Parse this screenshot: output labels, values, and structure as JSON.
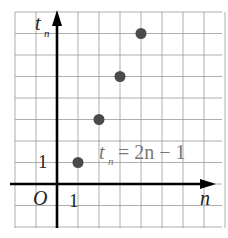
{
  "chart_data": {
    "type": "scatter",
    "title": "",
    "xlabel": "n",
    "ylabel": "t_n",
    "x": [
      1,
      2,
      3,
      4
    ],
    "y": [
      1,
      3,
      5,
      7
    ],
    "annotation": "t_n = 2n − 1",
    "origin_label": "O",
    "x_tick_labels": [
      "1"
    ],
    "y_tick_labels": [
      "1"
    ],
    "grid": true,
    "xlim": [
      -2,
      8
    ],
    "ylim": [
      -2,
      8
    ]
  },
  "labels": {
    "y_axis_main": "t",
    "y_axis_sub": "n",
    "x_axis": "n",
    "origin": "O",
    "x_tick": "1",
    "y_tick": "1",
    "formula_t": "t",
    "formula_sub": "n",
    "formula_rhs": "= 2n − 1"
  },
  "colors": {
    "grid": "#9a9a9a",
    "axis": "#000000",
    "point": "#4a4a4a",
    "formula": "#7a7a7a"
  }
}
